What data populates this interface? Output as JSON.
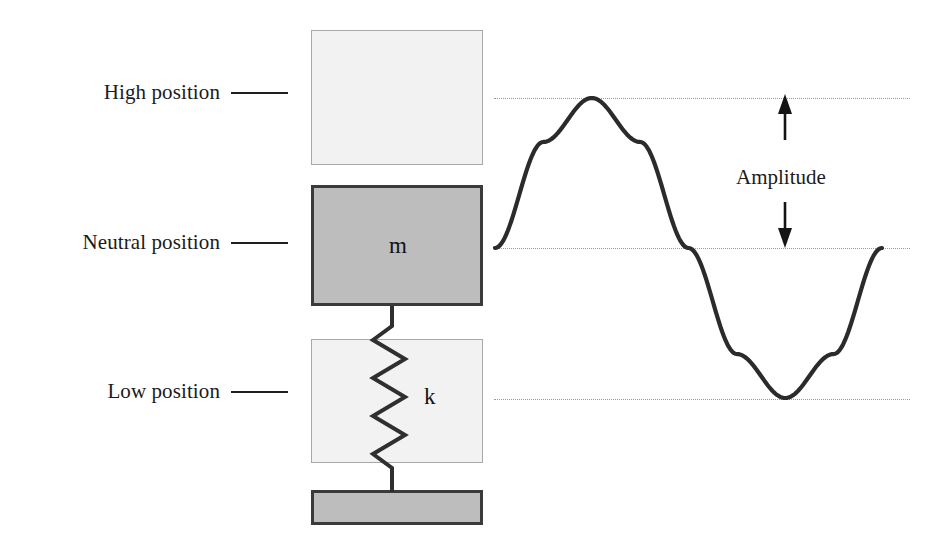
{
  "figure": {
    "labels": {
      "high_position": "High position",
      "neutral_position": "Neutral position",
      "low_position": "Low position",
      "amplitude": "Amplitude",
      "mass_symbol": "m",
      "spring_symbol": "k"
    },
    "colors": {
      "ghost_fill": "#f2f2f2",
      "ghost_stroke": "#a8a8a8",
      "solid_fill": "#bdbdbd",
      "solid_stroke": "#3a3a3a",
      "wave_stroke": "#2b2b2b",
      "guide_stroke": "#9b9b9b",
      "text": "#1b1b1b"
    }
  },
  "chart_data": {
    "type": "line",
    "xlabel": "",
    "ylabel": "",
    "series": [
      {
        "name": "displacement",
        "description": "one full sine cycle starting at the neutral position moving upward",
        "x": [
          0,
          0.125,
          0.25,
          0.375,
          0.5,
          0.625,
          0.75,
          0.875,
          1
        ],
        "y": [
          0,
          0.707,
          1,
          0.707,
          0,
          -0.707,
          -1,
          -0.707,
          0
        ]
      }
    ],
    "reference_lines": [
      {
        "name": "high-position",
        "y": 1,
        "style": "dotted",
        "label": "High position"
      },
      {
        "name": "neutral-position",
        "y": 0,
        "style": "dotted",
        "label": "Neutral position"
      },
      {
        "name": "low-position",
        "y": -1,
        "style": "dotted",
        "label": "Low position"
      }
    ],
    "annotations": [
      {
        "name": "amplitude",
        "text": "Amplitude",
        "from_y": 0,
        "to_y": 1,
        "double_headed": true
      }
    ],
    "ylim": [
      -1.25,
      1.25
    ],
    "xlim": [
      0,
      1
    ],
    "grid": false,
    "legend": "none"
  }
}
